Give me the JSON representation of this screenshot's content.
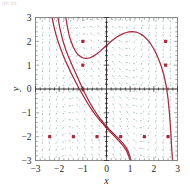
{
  "figure": {
    "corner_artifact": "dy/dx",
    "background": "#ffffff"
  },
  "colors": {
    "curve": "#a52a3c",
    "point": "#a52a3c",
    "slope_field": "#9ab3b3",
    "axis": "#231f20",
    "frame": "#808080",
    "tick_label": "#231f20"
  },
  "axes": {
    "xlabel": "x",
    "ylabel": "y",
    "xlim": [
      -3,
      3
    ],
    "ylim": [
      -3,
      3
    ],
    "xticks": [
      -3,
      -2,
      -1,
      0,
      1,
      2,
      3
    ],
    "yticks": [
      -3,
      -2,
      -1,
      0,
      1,
      2,
      3
    ],
    "xtick_labels": [
      "-3",
      "-2",
      "-1",
      "0",
      "1",
      "2",
      "3"
    ],
    "ytick_labels": [
      "-3",
      "-2",
      "-1",
      "0",
      "1",
      "2",
      "3"
    ],
    "minor_ticks": true,
    "grid": false,
    "frame": true
  },
  "chart_data": {
    "type": "line",
    "title": "",
    "subtitle": "",
    "xlabel": "x",
    "ylabel": "y",
    "xlim": [
      -3,
      3
    ],
    "ylim": [
      -3,
      3
    ],
    "grid": false,
    "legend": null,
    "plot_kind": "slope-field-with-solution-curves",
    "slope_field": {
      "style": "dashed short line segments",
      "color": "#9ab3b3",
      "x_samples": [
        -2.7,
        -2.4,
        -2.1,
        -1.8,
        -1.5,
        -1.2,
        -0.9,
        -0.6,
        -0.3,
        0.0,
        0.3,
        0.6,
        0.9,
        1.2,
        1.5,
        1.8,
        2.1,
        2.4,
        2.7
      ],
      "y_samples": [
        -2.8,
        -2.5,
        -2.2,
        -1.9,
        -1.6,
        -1.3,
        -1.0,
        -0.7,
        -0.4,
        -0.1,
        0.2,
        0.5,
        0.8,
        1.1,
        1.4,
        1.7,
        2.0,
        2.3,
        2.6,
        2.9
      ],
      "description": "Direction field segments; near-vertical at left and right edges, shallow/horizontal in the central upper band, sloping down-right in the lower half."
    },
    "series": [
      {
        "name": "solution-curve-1",
        "color": "#a52a3c",
        "comment": "Upper branch: falls steeply from top-left, flattens into a basin near (-0.7,1.3), rises to a crest near (1.1,2.4), then plunges steeply down through x~2.65 to the bottom edge.",
        "points": [
          [
            -1.72,
            3.0
          ],
          [
            -1.65,
            2.6
          ],
          [
            -1.58,
            2.25
          ],
          [
            -1.5,
            2.0
          ],
          [
            -1.4,
            1.75
          ],
          [
            -1.3,
            1.57
          ],
          [
            -1.2,
            1.44
          ],
          [
            -1.1,
            1.36
          ],
          [
            -1.0,
            1.31
          ],
          [
            -0.9,
            1.29
          ],
          [
            -0.8,
            1.29
          ],
          [
            -0.7,
            1.31
          ],
          [
            -0.55,
            1.38
          ],
          [
            -0.4,
            1.48
          ],
          [
            -0.25,
            1.6
          ],
          [
            -0.1,
            1.74
          ],
          [
            0.05,
            1.87
          ],
          [
            0.2,
            2.0
          ],
          [
            0.35,
            2.12
          ],
          [
            0.5,
            2.22
          ],
          [
            0.65,
            2.3
          ],
          [
            0.8,
            2.36
          ],
          [
            0.95,
            2.4
          ],
          [
            1.1,
            2.41
          ],
          [
            1.25,
            2.39
          ],
          [
            1.4,
            2.33
          ],
          [
            1.55,
            2.24
          ],
          [
            1.7,
            2.1
          ],
          [
            1.85,
            1.92
          ],
          [
            2.0,
            1.68
          ],
          [
            2.15,
            1.38
          ],
          [
            2.3,
            1.0
          ],
          [
            2.42,
            0.6
          ],
          [
            2.52,
            0.15
          ],
          [
            2.6,
            -0.4
          ],
          [
            2.66,
            -1.0
          ],
          [
            2.71,
            -1.7
          ],
          [
            2.75,
            -2.4
          ],
          [
            2.79,
            -3.0
          ]
        ]
      },
      {
        "name": "solution-curve-2",
        "color": "#a52a3c",
        "comment": "Left descending branch entering at the top edge near x=-2.05 and falling steeply toward the lower right, passing the saddle near (-1,0).",
        "points": [
          [
            -2.05,
            3.0
          ],
          [
            -1.98,
            2.6
          ],
          [
            -1.9,
            2.25
          ],
          [
            -1.82,
            1.95
          ],
          [
            -1.72,
            1.65
          ],
          [
            -1.62,
            1.38
          ],
          [
            -1.52,
            1.15
          ],
          [
            -1.42,
            0.92
          ],
          [
            -1.32,
            0.7
          ],
          [
            -1.22,
            0.48
          ],
          [
            -1.12,
            0.26
          ],
          [
            -1.02,
            0.04
          ],
          [
            -0.92,
            -0.17
          ],
          [
            -0.8,
            -0.4
          ],
          [
            -0.68,
            -0.62
          ],
          [
            -0.54,
            -0.85
          ],
          [
            -0.4,
            -1.06
          ],
          [
            -0.24,
            -1.28
          ],
          [
            -0.06,
            -1.5
          ],
          [
            0.12,
            -1.7
          ],
          [
            0.32,
            -1.9
          ],
          [
            0.52,
            -2.09
          ],
          [
            0.7,
            -2.28
          ],
          [
            0.84,
            -2.47
          ],
          [
            0.94,
            -2.68
          ],
          [
            1.0,
            -2.86
          ],
          [
            1.04,
            -3.0
          ]
        ]
      },
      {
        "name": "solution-curve-3",
        "color": "#a52a3c",
        "comment": "A second nearly-parallel branch just left/below curve 2, also entering at the top edge and exiting the bottom near x=0.98.",
        "points": [
          [
            -2.3,
            3.0
          ],
          [
            -2.22,
            2.62
          ],
          [
            -2.14,
            2.3
          ],
          [
            -2.05,
            2.0
          ],
          [
            -1.95,
            1.72
          ],
          [
            -1.85,
            1.46
          ],
          [
            -1.74,
            1.2
          ],
          [
            -1.63,
            0.96
          ],
          [
            -1.52,
            0.72
          ],
          [
            -1.4,
            0.48
          ],
          [
            -1.28,
            0.25
          ],
          [
            -1.16,
            0.02
          ],
          [
            -1.03,
            -0.2
          ],
          [
            -0.9,
            -0.43
          ],
          [
            -0.76,
            -0.66
          ],
          [
            -0.6,
            -0.9
          ],
          [
            -0.44,
            -1.12
          ],
          [
            -0.26,
            -1.34
          ],
          [
            -0.07,
            -1.56
          ],
          [
            0.13,
            -1.78
          ],
          [
            0.34,
            -1.99
          ],
          [
            0.54,
            -2.2
          ],
          [
            0.72,
            -2.41
          ],
          [
            0.86,
            -2.62
          ],
          [
            0.95,
            -2.83
          ],
          [
            0.99,
            -3.0
          ]
        ]
      }
    ],
    "markers": {
      "name": "initial-condition-points",
      "shape": "square-dot",
      "color": "#a52a3c",
      "size_px": 3.2,
      "points": [
        [
          -1.0,
          2.0
        ],
        [
          -1.0,
          1.0
        ],
        [
          -1.0,
          0.0
        ],
        [
          2.5,
          2.0
        ],
        [
          2.5,
          1.0
        ],
        [
          -2.4,
          -2.0
        ],
        [
          -1.4,
          -2.0
        ],
        [
          -0.4,
          -2.0
        ],
        [
          0.6,
          -2.0
        ],
        [
          1.6,
          -2.0
        ],
        [
          2.6,
          -2.0
        ]
      ]
    }
  }
}
